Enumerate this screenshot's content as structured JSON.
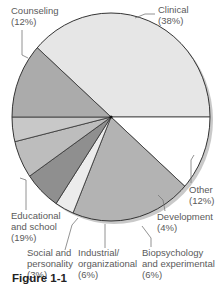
{
  "chart_data": {
    "type": "pie",
    "title": "",
    "caption": "Figure 1-1",
    "categories": [
      "Clinical",
      "Counseling",
      "Educational and school",
      "Social and personality",
      "Industrial/organizational",
      "Biopsychology and experimental",
      "Development",
      "Other"
    ],
    "values": [
      38,
      12,
      19,
      3,
      6,
      6,
      4,
      12
    ],
    "unit": "%",
    "colors": [
      "#e6e6e6",
      "#ffffff",
      "#b3b3b3",
      "#ececec",
      "#8f8f8f",
      "#bdbdbd",
      "#c8c8c8",
      "#ababab"
    ],
    "legend": "none (direct callout labels)"
  },
  "labels": {
    "clinical": "Clinical\n(38%)",
    "counseling": "Counseling\n(12%)",
    "educational": "Educational\nand school\n(19%)",
    "social": "Social and\npersonality\n(3%)",
    "industrial": "Industrial/\norganizational\n(6%)",
    "bio": "Biopsychology\nand experimental\n(6%)",
    "development": "Development\n(4%)",
    "other": "Other\n(12%)"
  },
  "figure_label": "Figure 1-1"
}
